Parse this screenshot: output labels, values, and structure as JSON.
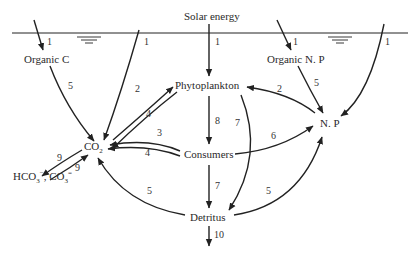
{
  "diagram": {
    "title": "Solar energy",
    "nodes": {
      "solar": "Solar energy",
      "organic_c": "Organic C",
      "organic_np": "Organic N. P",
      "phytoplankton": "Phytoplankton",
      "co2": "CO",
      "co2_sub": "2",
      "np": "N. P",
      "consumers": "Consumers",
      "detritus": "Detritus",
      "carbonate_a": "HCO",
      "carbonate_a_sub": "3",
      "carbonate_a_sup": "−",
      "carbonate_sep": ", CO",
      "carbonate_b_sub": "3",
      "carbonate_b_sup": "="
    },
    "edges": [
      {
        "from": "atmosphere",
        "to": "Organic C",
        "label": "1"
      },
      {
        "from": "atmosphere",
        "to": "CO2",
        "label": "1"
      },
      {
        "from": "Solar energy",
        "to": "Phytoplankton",
        "label": "1"
      },
      {
        "from": "atmosphere",
        "to": "Organic N. P",
        "label": "1"
      },
      {
        "from": "atmosphere",
        "to": "N. P",
        "label": "1"
      },
      {
        "from": "Organic C",
        "to": "CO2",
        "label": "5"
      },
      {
        "from": "CO2",
        "to": "Phytoplankton",
        "label": "2"
      },
      {
        "from": "Phytoplankton",
        "to": "CO2",
        "label": "4"
      },
      {
        "from": "Consumers",
        "to": "CO2",
        "label": "3"
      },
      {
        "from": "Consumers",
        "to": "CO2",
        "label": "4"
      },
      {
        "from": "CO2",
        "to": "HCO3-, CO3=",
        "label": "9"
      },
      {
        "from": "HCO3-, CO3=",
        "to": "CO2",
        "label": "9"
      },
      {
        "from": "Detritus",
        "to": "CO2",
        "label": "5"
      },
      {
        "from": "Phytoplankton",
        "to": "Consumers",
        "label": "8"
      },
      {
        "from": "Phytoplankton",
        "to": "Detritus",
        "label": "7"
      },
      {
        "from": "Consumers",
        "to": "Detritus",
        "label": "7"
      },
      {
        "from": "N. P",
        "to": "Phytoplankton",
        "label": "2"
      },
      {
        "from": "Organic N. P",
        "to": "N. P",
        "label": "5"
      },
      {
        "from": "Consumers",
        "to": "N. P",
        "label": "6"
      },
      {
        "from": "Detritus",
        "to": "N. P",
        "label": "5"
      },
      {
        "from": "Detritus",
        "to": "sediment",
        "label": "10"
      }
    ],
    "labels": {
      "l1a": "1",
      "l1b": "1",
      "l1c": "1",
      "l1d": "1",
      "l1e": "1",
      "l5a": "5",
      "l2a": "2",
      "l4a": "4",
      "l3": "3",
      "l4b": "4",
      "l9a": "9",
      "l9b": "9",
      "l5b": "5",
      "l8": "8",
      "l7a": "7",
      "l7b": "7",
      "l2b": "2",
      "l5c": "5",
      "l6": "6",
      "l5d": "5",
      "l10": "10"
    },
    "water_surface_symbol": "water-level"
  }
}
